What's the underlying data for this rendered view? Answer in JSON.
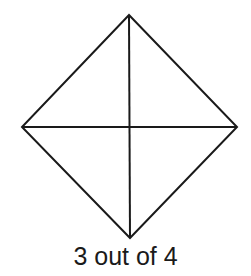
{
  "diagram": {
    "shape": "rhombus",
    "stroke_color": "#1a1a1a",
    "stroke_width": 2,
    "vertices": {
      "top": [
        129,
        15
      ],
      "right": [
        237,
        127
      ],
      "bottom": [
        130,
        238
      ],
      "left": [
        22,
        127
      ]
    },
    "diagonals": [
      {
        "from": "top",
        "to": "bottom"
      },
      {
        "from": "left",
        "to": "right"
      }
    ],
    "regions": 4,
    "shaded_regions": 0
  },
  "caption": "3 out of 4"
}
